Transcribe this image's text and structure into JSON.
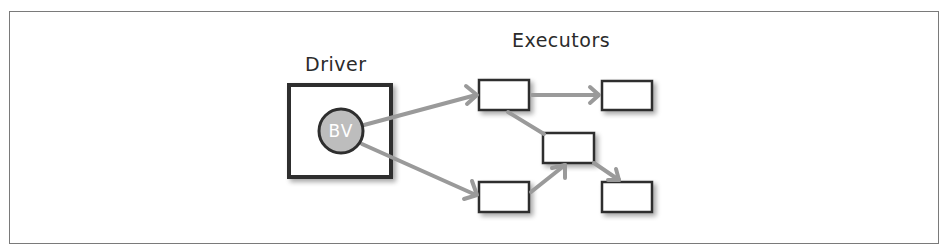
{
  "diagram": {
    "driver": {
      "label": "Driver",
      "broadcast_variable": {
        "label": "BV"
      }
    },
    "executors": {
      "label": "Executors",
      "nodes": [
        {
          "id": "executor-1",
          "label": ""
        },
        {
          "id": "executor-2",
          "label": ""
        },
        {
          "id": "executor-3",
          "label": ""
        },
        {
          "id": "executor-4",
          "label": ""
        },
        {
          "id": "executor-5",
          "label": ""
        }
      ]
    },
    "edges": [
      {
        "from": "BV",
        "to": "executor-1",
        "arrow": true
      },
      {
        "from": "BV",
        "to": "executor-4",
        "arrow": true
      },
      {
        "from": "executor-1",
        "to": "executor-2",
        "arrow": true
      },
      {
        "from": "executor-1",
        "to": "executor-3",
        "arrow": false
      },
      {
        "from": "executor-4",
        "to": "executor-3",
        "arrow": true
      },
      {
        "from": "executor-3",
        "to": "executor-5",
        "arrow": true
      }
    ],
    "colors": {
      "box_stroke": "#2e2e2e",
      "arrow": "#9a9a9a",
      "bv_fill": "#bdbdbd",
      "frame": "#7a7a7a",
      "text": "#2b2b2b"
    }
  }
}
